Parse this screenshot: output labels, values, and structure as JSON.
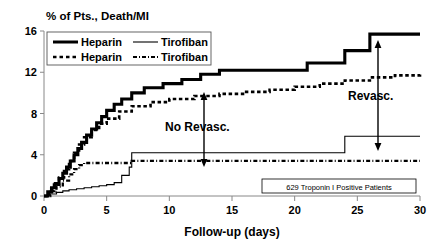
{
  "chart_data": {
    "type": "line",
    "title": "% of Pts., Death/MI",
    "xlabel": "Follow-up (days)",
    "ylabel": "",
    "xlim": [
      0,
      30
    ],
    "ylim": [
      0,
      16
    ],
    "xticks": [
      0,
      5,
      10,
      15,
      20,
      25,
      30
    ],
    "yticks": [
      0,
      4,
      8,
      12,
      16
    ],
    "grid": false,
    "legend_position": "top-left",
    "annotations": [
      {
        "text": "No Revasc.",
        "x": 13.5,
        "y": 7.0
      },
      {
        "text": "Revasc.",
        "x": 25.5,
        "y": 8.5
      },
      {
        "text": "629 Troponin I Positive Patients",
        "x": 24.0,
        "y": 1.3
      }
    ],
    "series": [
      {
        "name": "Heparin",
        "group": "Revasc.",
        "style": "thick-solid",
        "color": "#000000",
        "x": [
          0,
          0.3,
          0.6,
          0.9,
          1.2,
          1.5,
          1.8,
          2.1,
          2.4,
          2.7,
          3.0,
          3.4,
          3.8,
          4.2,
          4.6,
          5.0,
          5.6,
          6.2,
          7.0,
          8.0,
          9.5,
          11.0,
          12.5,
          14.0,
          16.0,
          19.0,
          21.0,
          23.0,
          24.0,
          26.0,
          30.0
        ],
        "y": [
          0.0,
          0.4,
          0.8,
          1.2,
          1.7,
          2.2,
          2.8,
          3.4,
          4.0,
          4.6,
          5.2,
          5.9,
          6.5,
          7.1,
          7.7,
          8.3,
          8.9,
          9.4,
          10.0,
          10.5,
          10.9,
          11.3,
          11.8,
          12.2,
          12.2,
          12.2,
          12.9,
          12.9,
          14.1,
          15.7,
          15.7
        ]
      },
      {
        "name": "Heparin",
        "group": "No Revasc.",
        "style": "dashed",
        "color": "#000000",
        "x": [
          0,
          0.4,
          0.8,
          1.2,
          1.6,
          2.0,
          2.4,
          2.8,
          3.2,
          3.8,
          4.4,
          5.0,
          6.0,
          7.0,
          8.5,
          10.0,
          12.0,
          14.0,
          16.0,
          18.0,
          20.0,
          22.0,
          24.0,
          26.0,
          28.0,
          30.0
        ],
        "y": [
          0.0,
          0.5,
          1.1,
          1.8,
          2.6,
          3.4,
          4.2,
          5.0,
          5.7,
          6.4,
          7.0,
          7.5,
          8.2,
          8.7,
          9.1,
          9.4,
          9.7,
          9.9,
          10.1,
          10.3,
          10.6,
          10.9,
          11.2,
          11.5,
          11.7,
          11.8
        ]
      },
      {
        "name": "Tirofiban",
        "group": "Revasc.",
        "style": "thin-solid",
        "color": "#000000",
        "x": [
          0,
          0.5,
          1.0,
          1.5,
          2.0,
          2.6,
          3.2,
          3.8,
          4.4,
          5.0,
          5.6,
          6.2,
          6.8,
          7.0,
          12.0,
          18.0,
          23.5,
          24.0,
          30.0
        ],
        "y": [
          0.0,
          0.2,
          0.35,
          0.5,
          0.6,
          0.7,
          0.8,
          0.9,
          1.0,
          1.1,
          1.3,
          2.0,
          2.8,
          4.2,
          4.2,
          4.2,
          4.2,
          5.8,
          5.8
        ]
      },
      {
        "name": "Tirofiban",
        "group": "No Revasc.",
        "style": "dash-dot",
        "color": "#000000",
        "x": [
          0,
          0.5,
          1.0,
          1.5,
          2.0,
          2.4,
          2.8,
          3.2,
          7.0,
          12.0,
          18.0,
          24.0,
          30.0
        ],
        "y": [
          0.0,
          0.4,
          0.9,
          1.5,
          2.1,
          2.6,
          3.0,
          3.2,
          3.4,
          3.4,
          3.4,
          3.4,
          3.4
        ]
      }
    ]
  },
  "legend": {
    "entries": [
      {
        "label": "Heparin",
        "style": "thick-solid"
      },
      {
        "label": "Tirofiban",
        "style": "thin-solid"
      },
      {
        "label": "Heparin",
        "style": "dashed"
      },
      {
        "label": "Tirofiban",
        "style": "dash-dot"
      }
    ]
  },
  "axes": {
    "title": "% of Pts., Death/MI",
    "xlabel": "Follow-up (days)",
    "ytick_labels": [
      "0",
      "4",
      "8",
      "12",
      "16"
    ],
    "xtick_labels": [
      "0",
      "5",
      "10",
      "15",
      "20",
      "25",
      "30"
    ]
  },
  "footnote": {
    "text": "629 Troponin I Positive Patients"
  },
  "callouts": {
    "no_revasc": "No Revasc.",
    "revasc": "Revasc."
  }
}
